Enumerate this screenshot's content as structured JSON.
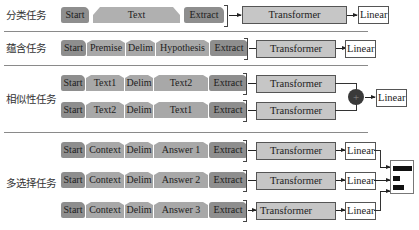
{
  "tasks": [
    {
      "label": "分类任务",
      "rows": [
        {
          "tokens": [
            "Start",
            "Text",
            "Extract"
          ],
          "transformer": "Transformer",
          "linear": "Linear"
        }
      ]
    },
    {
      "label": "蕴含任务",
      "rows": [
        {
          "tokens": [
            "Start",
            "Premise",
            "Delim",
            "Hypothesis",
            "Extract"
          ],
          "transformer": "Transformer",
          "linear": "Linear"
        }
      ]
    },
    {
      "label": "相似性任务",
      "rows": [
        {
          "tokens": [
            "Start",
            "Text1",
            "Delim",
            "Text2",
            "Extract"
          ],
          "transformer": "Transformer"
        },
        {
          "tokens": [
            "Start",
            "Text2",
            "Delim",
            "Text1",
            "Extract"
          ],
          "transformer": "Transformer"
        }
      ],
      "combine": {
        "icon": "plus-circle-icon",
        "symbol": "+"
      },
      "linear": "Linear"
    },
    {
      "label": "多选择任务",
      "rows": [
        {
          "tokens": [
            "Start",
            "Context",
            "Delim",
            "Answer 1",
            "Extract"
          ],
          "transformer": "Transformer",
          "linear": "Linear"
        },
        {
          "tokens": [
            "Start",
            "Context",
            "Delim",
            "Answer 2",
            "Extract"
          ],
          "transformer": "Transformer",
          "linear": "Linear"
        },
        {
          "tokens": [
            "Start",
            "Context",
            "Delim",
            "Answer 3",
            "Extract"
          ],
          "transformer": "Transformer",
          "linear": "Linear"
        }
      ],
      "output": {
        "icon": "softmax-bars-icon",
        "bar_fractions": [
          1.0,
          0.35,
          0.6
        ]
      }
    }
  ],
  "colors": {
    "token_dark": "#8e8e8e",
    "token_light": "#b0b0b0",
    "transformer": "#c6c6c6",
    "linear": "#ffffff",
    "separator": "#8a8a8a"
  }
}
